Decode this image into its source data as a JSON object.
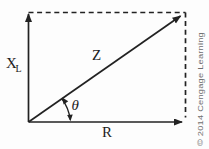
{
  "figure": {
    "type": "impedance-phasor-right-triangle-diagram",
    "labels": {
      "inductive_reactance_main": "X",
      "inductive_reactance_sub": "L",
      "impedance": "Z",
      "phase_angle": "θ",
      "resistance": "R"
    },
    "credit": "© 2014 Cengage Learning",
    "colors": {
      "line": "#222222",
      "label_text": "#1c1c1c",
      "credit_text": "#6e6e6e",
      "background": "#fdfdfd"
    }
  }
}
